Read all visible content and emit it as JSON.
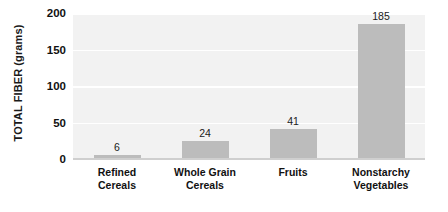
{
  "chart_data": {
    "type": "bar",
    "title": "",
    "xlabel": "",
    "ylabel": "TOTAL FIBER (grams)",
    "categories": [
      "Refined Cereals",
      "Whole Grain Cereals",
      "Fruits",
      "Nonstarchy Vegetables"
    ],
    "category_lines": [
      [
        "Refined",
        "Cereals"
      ],
      [
        "Whole Grain",
        "Cereals"
      ],
      [
        "Fruits"
      ],
      [
        "Nonstarchy",
        "Vegetables"
      ]
    ],
    "values": [
      6,
      24,
      41,
      185
    ],
    "value_labels": [
      "6",
      "24",
      "41",
      "185"
    ],
    "ylim": [
      0,
      200
    ],
    "yticks": [
      0,
      50,
      100,
      150,
      200
    ],
    "ytick_labels": [
      "0",
      "50",
      "100",
      "150",
      "200"
    ],
    "grid": true,
    "legend": "none",
    "colors": {
      "bar_fill": "#bcbcbc",
      "plot_background": "#f2f2f2",
      "gridline": "#ffffff",
      "axis_text": "#111111",
      "page_background": "#ffffff"
    }
  }
}
